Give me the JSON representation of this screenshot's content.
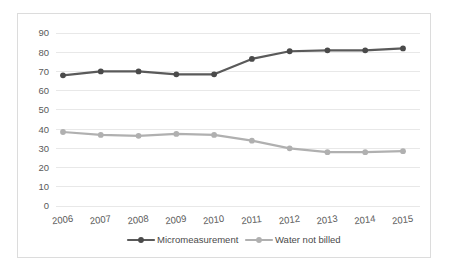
{
  "chart_data": {
    "type": "line",
    "title": "",
    "subtitle": "",
    "xlabel": "",
    "ylabel": "",
    "categories": [
      "2006",
      "2007",
      "2008",
      "2009",
      "2010",
      "2011",
      "2012",
      "2013",
      "2014",
      "2015"
    ],
    "series": [
      {
        "name": "Micromeasurement",
        "color": "#5a5a5a",
        "marker": "circle",
        "values": [
          68,
          70,
          70,
          68.5,
          68.5,
          76.5,
          80.5,
          81,
          81,
          82
        ]
      },
      {
        "name": "Water not billed",
        "color": "#b0b0b0",
        "marker": "circle",
        "values": [
          38.5,
          37,
          36.5,
          37.5,
          37,
          34,
          30,
          28,
          28,
          28.5
        ]
      }
    ],
    "ylim": [
      0,
      90
    ],
    "ytick_values": [
      0,
      10,
      20,
      30,
      40,
      50,
      60,
      70,
      80,
      90
    ],
    "ytick_labels": [
      "0",
      "10",
      "20",
      "30",
      "40",
      "50",
      "60",
      "70",
      "80",
      "90"
    ],
    "grid": true,
    "grid_axis": "y",
    "legend_position": "bottom",
    "legend": [
      "Micromeasurement",
      "Water not billed"
    ],
    "colors": {
      "series_dark": "#5a5a5a",
      "series_light": "#b0b0b0",
      "gridline": "#e8e8e8",
      "tick_text": "#5a5a5a",
      "frame_border": "#dcdcdc",
      "background": "#ffffff"
    }
  }
}
